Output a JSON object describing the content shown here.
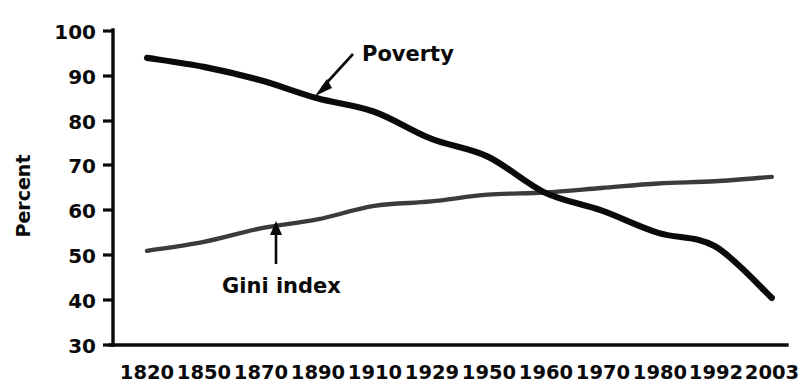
{
  "chart_data": {
    "type": "line",
    "title": "",
    "xlabel": "",
    "ylabel": "Percent",
    "categories": [
      "1820",
      "1850",
      "1870",
      "1890",
      "1910",
      "1929",
      "1950",
      "1960",
      "1970",
      "1980",
      "1992",
      "2003"
    ],
    "x_tick_labels": [
      "1820",
      "1850",
      "1870",
      "1890",
      "1910",
      "1929",
      "1950",
      "1960",
      "1970",
      "1980",
      "1992",
      "2003"
    ],
    "y_tick_labels": [
      "100",
      "90",
      "80",
      "70",
      "60",
      "50",
      "40",
      "30"
    ],
    "y_ticks": [
      100,
      90,
      80,
      70,
      60,
      50,
      40,
      30
    ],
    "ylim": [
      30,
      100
    ],
    "grid": false,
    "legend_position": "inline-annotation",
    "series": [
      {
        "name": "Poverty",
        "color": "#0a0a0a",
        "values": [
          94,
          92,
          89,
          85,
          82,
          76,
          72,
          64,
          60,
          55,
          52,
          40.5
        ]
      },
      {
        "name": "Gini index",
        "color": "#3b3b3b",
        "values": [
          51,
          53,
          56,
          58,
          61,
          62,
          63.5,
          64,
          65,
          66,
          66.5,
          67.5
        ]
      }
    ],
    "annotations": [
      {
        "text": "Poverty",
        "series": "Poverty",
        "arrow": "down-left"
      },
      {
        "text": "Gini index",
        "series": "Gini index",
        "arrow": "up"
      }
    ]
  }
}
